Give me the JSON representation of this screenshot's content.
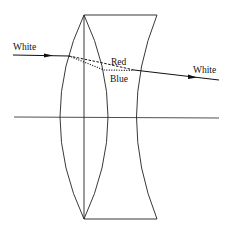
{
  "diagram": {
    "labels": {
      "incoming": "White",
      "outgoing": "White",
      "red": "Red",
      "blue": "Blue"
    },
    "colors": {
      "line": "#111111",
      "background": "#ffffff"
    }
  }
}
